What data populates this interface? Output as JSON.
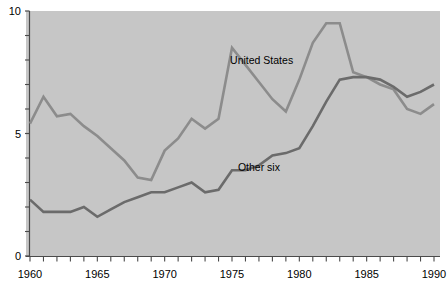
{
  "chart_data": {
    "type": "line",
    "title": "",
    "subtitle": "",
    "xlabel": "",
    "ylabel": "",
    "xlim": [
      1960,
      1990
    ],
    "ylim": [
      0,
      10
    ],
    "grid": false,
    "legend_position": "inline-annotation",
    "x": [
      1960,
      1961,
      1962,
      1963,
      1964,
      1965,
      1966,
      1967,
      1968,
      1969,
      1970,
      1971,
      1972,
      1973,
      1974,
      1975,
      1976,
      1977,
      1978,
      1979,
      1980,
      1981,
      1982,
      1983,
      1984,
      1985,
      1986,
      1987,
      1988,
      1989,
      1990
    ],
    "series": [
      {
        "name": "United States",
        "color": "#8c8c8c",
        "values": [
          5.4,
          6.5,
          5.7,
          5.8,
          5.3,
          4.9,
          4.4,
          3.9,
          3.2,
          3.1,
          4.3,
          4.8,
          5.6,
          5.2,
          5.6,
          8.5,
          7.8,
          7.1,
          6.4,
          5.9,
          7.2,
          8.7,
          9.5,
          9.5,
          7.5,
          7.3,
          7.0,
          6.8,
          6.0,
          5.8,
          6.2
        ]
      },
      {
        "name": "Other six",
        "color": "#6b6b6b",
        "values": [
          2.3,
          1.8,
          1.8,
          1.8,
          2.0,
          1.6,
          1.9,
          2.2,
          2.4,
          2.6,
          2.6,
          2.8,
          3.0,
          2.6,
          2.7,
          3.5,
          3.5,
          3.7,
          4.1,
          4.2,
          4.4,
          5.3,
          6.3,
          7.2,
          7.3,
          7.3,
          7.2,
          6.9,
          6.5,
          6.7,
          7.0
        ]
      }
    ],
    "y_axis": {
      "labeled_ticks": [
        "0",
        "5",
        "10"
      ],
      "labeled_values": [
        0,
        5,
        10
      ],
      "minor_tick_step": 1
    },
    "x_axis": {
      "labeled_ticks": [
        "1960",
        "1965",
        "1970",
        "1975",
        "1980",
        "1985",
        "1990"
      ],
      "labeled_values": [
        1960,
        1965,
        1970,
        1975,
        1980,
        1985,
        1990
      ],
      "minor_tick_step": 1
    },
    "annotations": [
      {
        "text": "United States",
        "x": 1977.2,
        "y": 7.85
      },
      {
        "text": "Other six",
        "x": 1977.0,
        "y": 3.45
      }
    ],
    "plot_background_color": "#c6c6c6",
    "page_background_color": "#ffffff",
    "axis_color": "#4a4a4a"
  }
}
